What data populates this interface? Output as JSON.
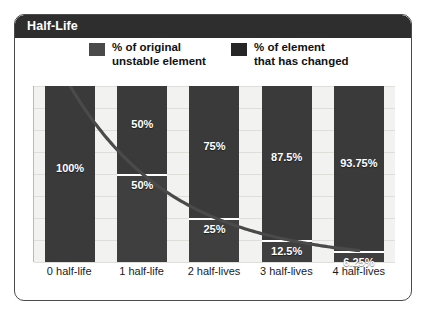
{
  "panel": {
    "title": "Half-Life"
  },
  "legend": {
    "items": [
      {
        "label_line1": "% of original",
        "label_line2": "unstable element",
        "color": "#4a4a4a",
        "key": "original"
      },
      {
        "label_line1": "% of element",
        "label_line2": "that has changed",
        "color": "#262626",
        "key": "changed"
      }
    ]
  },
  "chart_data": {
    "type": "bar",
    "title": "Half-Life",
    "xlabel": "",
    "ylabel": "",
    "ylim": [
      0,
      100
    ],
    "grid": true,
    "legend_position": "top",
    "categories": [
      "0 half-life",
      "1 half-life",
      "2 half-lives",
      "3 half-lives",
      "4 half-lives"
    ],
    "series": [
      {
        "name": "% of element that has changed",
        "color": "#262626",
        "values": [
          0,
          50,
          75,
          87.5,
          93.75
        ],
        "labels": [
          "",
          "50%",
          "75%",
          "87.5%",
          "93.75%"
        ]
      },
      {
        "name": "% of original unstable element",
        "color": "#4a4a4a",
        "values": [
          100,
          50,
          25,
          12.5,
          6.25
        ],
        "labels": [
          "100%",
          "50%",
          "25%",
          "12.5%",
          "6.25%"
        ]
      }
    ],
    "curve": {
      "name": "exponential decay of remaining unstable element",
      "color": "#4a4a4a",
      "x": [
        0,
        1,
        2,
        3,
        4
      ],
      "y": [
        100,
        50,
        25,
        12.5,
        6.25
      ]
    },
    "gridlines_y": [
      0,
      12.5,
      25,
      37.5,
      50,
      62.5,
      75,
      87.5,
      100
    ]
  },
  "bars": [
    {
      "category": "0 half-life",
      "top_label": "",
      "top_pct": 0,
      "bottom_label": "100%",
      "bottom_pct": 100
    },
    {
      "category": "1 half-life",
      "top_label": "50%",
      "top_pct": 50,
      "bottom_label": "50%",
      "bottom_pct": 50
    },
    {
      "category": "2 half-lives",
      "top_label": "75%",
      "top_pct": 75,
      "bottom_label": "25%",
      "bottom_pct": 25
    },
    {
      "category": "3 half-lives",
      "top_label": "87.5%",
      "top_pct": 87.5,
      "bottom_label": "12.5%",
      "bottom_pct": 12.5
    },
    {
      "category": "4 half-lives",
      "top_label": "93.75%",
      "top_pct": 93.75,
      "bottom_label": "6.25%",
      "bottom_pct": 6.25
    }
  ],
  "colors": {
    "title_bar": "#2e2e2e",
    "bar_changed": "#3a3a3a",
    "bar_original": "#3f3f3f",
    "plot_background": "#f2f2f0",
    "gridline": "#dededa",
    "curve": "#4a4a4a",
    "divider": "#ffffff"
  }
}
